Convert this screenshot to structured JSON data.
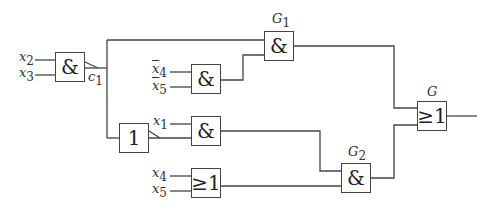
{
  "diagram": {
    "title": "",
    "gates": [
      {
        "id": "and1",
        "symbol": "&",
        "label": ""
      },
      {
        "id": "and_nx45",
        "symbol": "&",
        "label": ""
      },
      {
        "id": "G1",
        "symbol": "&",
        "label": "G",
        "label_sub": "1"
      },
      {
        "id": "not1",
        "symbol": "1",
        "label": ""
      },
      {
        "id": "and_x1",
        "symbol": "&",
        "label": ""
      },
      {
        "id": "or_x45",
        "symbol": "≥1",
        "label": ""
      },
      {
        "id": "G2",
        "symbol": "&",
        "label": "G",
        "label_sub": "2"
      },
      {
        "id": "G",
        "symbol": "≥1",
        "label": "G",
        "label_sub": ""
      }
    ],
    "inputs": [
      {
        "var": "x",
        "sub": "2",
        "negated": false
      },
      {
        "var": "x",
        "sub": "3",
        "negated": false
      },
      {
        "var": "x",
        "sub": "4",
        "negated": true
      },
      {
        "var": "x",
        "sub": "5",
        "negated": true
      },
      {
        "var": "x",
        "sub": "1",
        "negated": false
      },
      {
        "var": "x",
        "sub": "4",
        "negated": false
      },
      {
        "var": "x",
        "sub": "5",
        "negated": false
      }
    ],
    "signals": [
      {
        "var": "c",
        "sub": "1"
      }
    ],
    "colors": {
      "line": "#444444",
      "text": "#333333",
      "background": "#ffffff"
    }
  }
}
